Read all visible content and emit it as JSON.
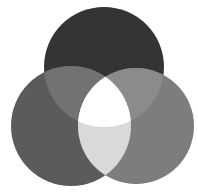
{
  "diagram": {
    "type": "three-circle-venn",
    "circles": [
      {
        "name": "top",
        "cx": 104,
        "cy": 67,
        "r": 60,
        "color": "#343434"
      },
      {
        "name": "left",
        "cx": 71,
        "cy": 126,
        "r": 60,
        "color": "#5b5b5b"
      },
      {
        "name": "right",
        "cx": 136,
        "cy": 126,
        "r": 58,
        "color": "#7d7d7d"
      }
    ],
    "intersections": {
      "top_left": "#727272",
      "top_right": "#8b8b8b",
      "left_right": "#d9d9d9",
      "all": "#ffffff"
    },
    "background": "#ffffff"
  }
}
